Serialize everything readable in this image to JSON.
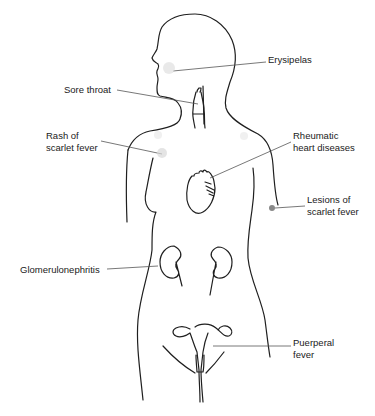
{
  "diagram": {
    "line_color": "#1f1f1f",
    "leader_color": "#555555",
    "lesion_color": "#bbbbbb",
    "labels": [
      {
        "id": "erysipelas",
        "lines": [
          "Erysipelas"
        ],
        "x": 268,
        "y": 59
      },
      {
        "id": "sore-throat",
        "lines": [
          "Sore throat"
        ],
        "x": 64,
        "y": 87
      },
      {
        "id": "rash-scarlet-fever",
        "lines": [
          "Rash of",
          "scarlet fever"
        ],
        "x": 46,
        "y": 133
      },
      {
        "id": "rheumatic-heart",
        "lines": [
          "Rheumatic",
          "heart diseases"
        ],
        "x": 293,
        "y": 133
      },
      {
        "id": "lesions-scarlet-fever",
        "lines": [
          "Lesions of",
          "scarlet fever"
        ],
        "x": 307,
        "y": 196
      },
      {
        "id": "glomerulonephritis",
        "lines": [
          "Glomerulonephritis"
        ],
        "x": 20,
        "y": 266
      },
      {
        "id": "puerperal-fever",
        "lines": [
          "Puerperal",
          "fever"
        ],
        "x": 293,
        "y": 339
      }
    ]
  }
}
